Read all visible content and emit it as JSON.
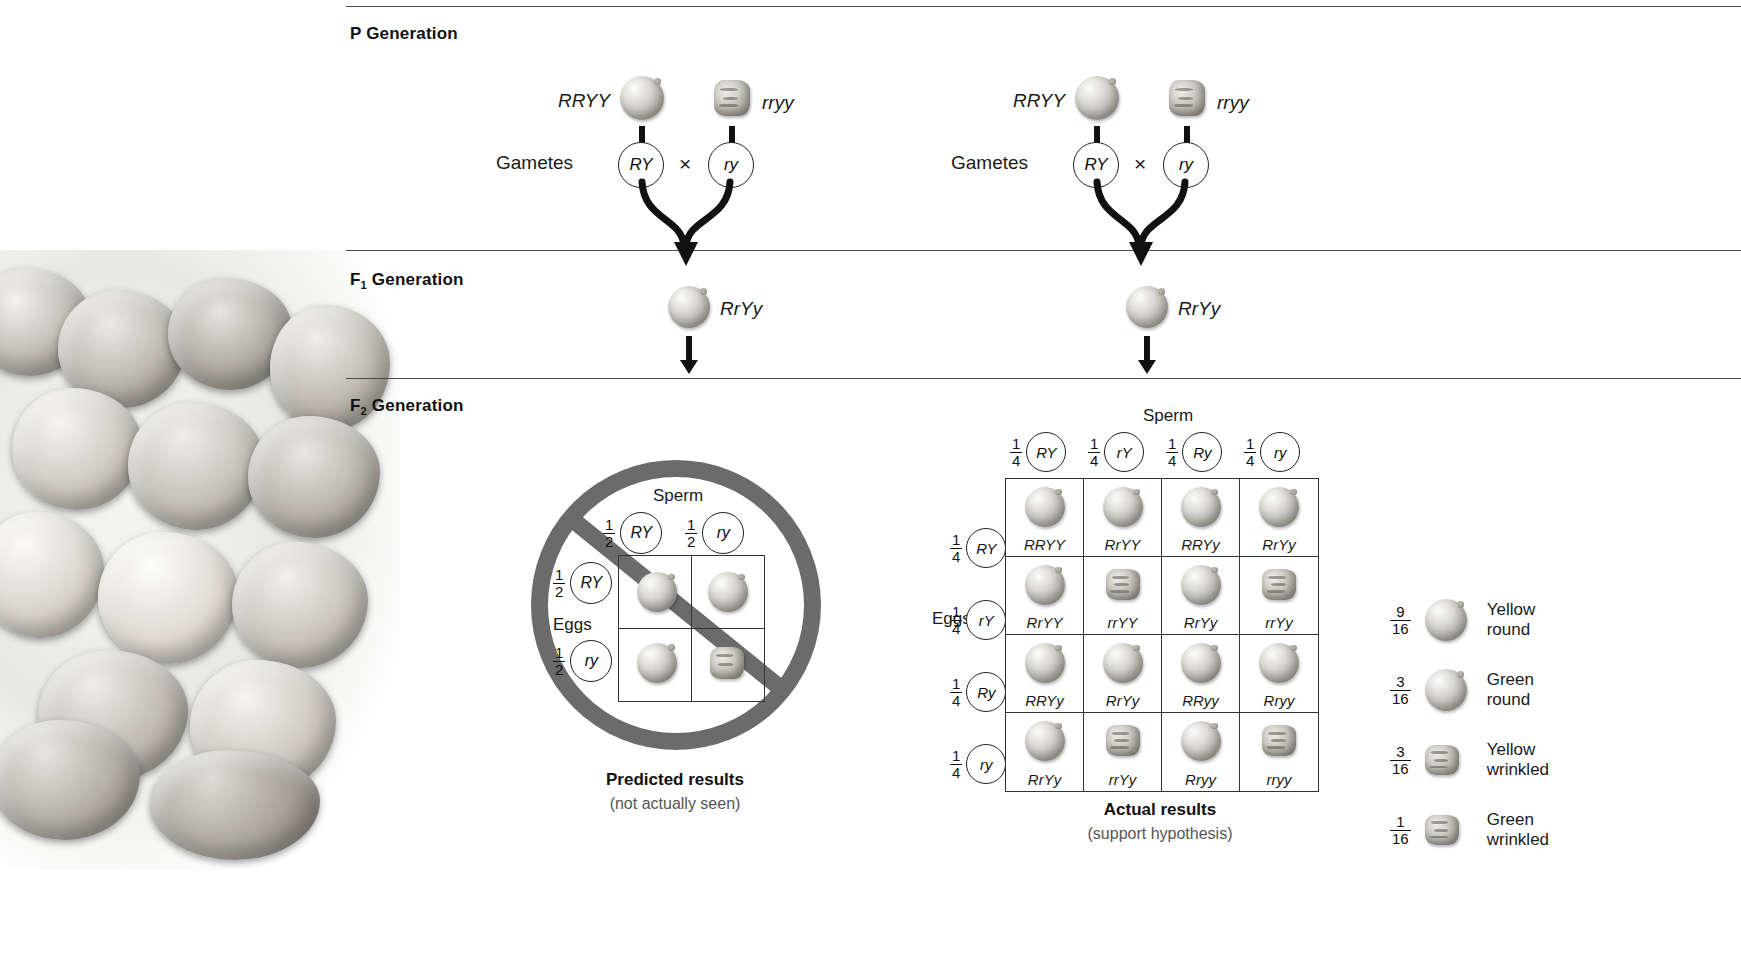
{
  "generations": {
    "p": {
      "label": "P Generation",
      "sub": ""
    },
    "f1": {
      "label": "F",
      "sub": "1",
      "suffix": " Generation"
    },
    "f2": {
      "label": "F",
      "sub": "2",
      "suffix": " Generation"
    }
  },
  "p_cross": {
    "parent1_genotype": "RRYY",
    "parent2_genotype": "rryy",
    "gametes_label": "Gametes",
    "gamete1": "RY",
    "gamete2": "ry",
    "cross_symbol": "×"
  },
  "f1_offspring": {
    "genotype": "RrYy"
  },
  "predicted": {
    "sperm_label": "Sperm",
    "eggs_label": "Eggs",
    "sperm_headers": [
      {
        "num": "1",
        "den": "2",
        "gamete": "RY"
      },
      {
        "num": "1",
        "den": "2",
        "gamete": "ry"
      }
    ],
    "egg_headers": [
      {
        "num": "1",
        "den": "2",
        "gamete": "RY"
      },
      {
        "num": "1",
        "den": "2",
        "gamete": "ry"
      }
    ],
    "cells": [
      {
        "shape": "round"
      },
      {
        "shape": "round"
      },
      {
        "shape": "round"
      },
      {
        "shape": "wrinkled"
      }
    ],
    "caption_title": "Predicted results",
    "caption_sub": "(not actually seen)"
  },
  "actual": {
    "sperm_label": "Sperm",
    "eggs_label": "Eggs",
    "sperm_headers": [
      {
        "num": "1",
        "den": "4",
        "gamete": "RY"
      },
      {
        "num": "1",
        "den": "4",
        "gamete": "rY"
      },
      {
        "num": "1",
        "den": "4",
        "gamete": "Ry"
      },
      {
        "num": "1",
        "den": "4",
        "gamete": "ry"
      }
    ],
    "egg_headers": [
      {
        "num": "1",
        "den": "4",
        "gamete": "RY"
      },
      {
        "num": "1",
        "den": "4",
        "gamete": "rY"
      },
      {
        "num": "1",
        "den": "4",
        "gamete": "Ry"
      },
      {
        "num": "1",
        "den": "4",
        "gamete": "ry"
      }
    ],
    "cells": [
      {
        "genotype": "RRYY",
        "shape": "round"
      },
      {
        "genotype": "RrYY",
        "shape": "round"
      },
      {
        "genotype": "RRYy",
        "shape": "round"
      },
      {
        "genotype": "RrYy",
        "shape": "round"
      },
      {
        "genotype": "RrYY",
        "shape": "round"
      },
      {
        "genotype": "rrYY",
        "shape": "wrinkled"
      },
      {
        "genotype": "RrYy",
        "shape": "round"
      },
      {
        "genotype": "rrYy",
        "shape": "wrinkled"
      },
      {
        "genotype": "RRYy",
        "shape": "round"
      },
      {
        "genotype": "RrYy",
        "shape": "round"
      },
      {
        "genotype": "RRyy",
        "shape": "round"
      },
      {
        "genotype": "Rryy",
        "shape": "round"
      },
      {
        "genotype": "RrYy",
        "shape": "round"
      },
      {
        "genotype": "rrYy",
        "shape": "wrinkled"
      },
      {
        "genotype": "Rryy",
        "shape": "round"
      },
      {
        "genotype": "rryy",
        "shape": "wrinkled"
      }
    ],
    "caption_title": "Actual results",
    "caption_sub": "(support hypothesis)"
  },
  "legend": {
    "items": [
      {
        "num": "9",
        "den": "16",
        "shape": "round",
        "line1": "Yellow",
        "line2": "round"
      },
      {
        "num": "3",
        "den": "16",
        "shape": "round",
        "line1": "Green",
        "line2": "round"
      },
      {
        "num": "3",
        "den": "16",
        "shape": "wrinkled",
        "line1": "Yellow",
        "line2": "wrinkled"
      },
      {
        "num": "1",
        "den": "16",
        "shape": "wrinkled",
        "line1": "Green",
        "line2": "wrinkled"
      }
    ]
  },
  "colors": {
    "rule": "#4a4a4a",
    "no_symbol": "#6b6b6b",
    "text": "#1a1a1a",
    "caption_sub": "#555555"
  }
}
